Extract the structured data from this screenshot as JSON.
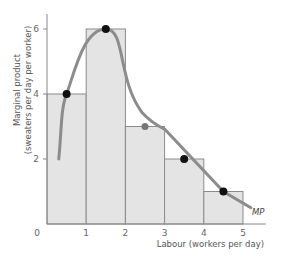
{
  "chart_data": {
    "type": "bar",
    "title": "",
    "xlabel": "Labour (workers per day)",
    "ylabel_line1": "Marginal product",
    "ylabel_line2": "(sweaters per day per worker)",
    "x_ticks": [
      "0",
      "1",
      "2",
      "3",
      "4",
      "5"
    ],
    "y_ticks": [
      "2",
      "4",
      "6"
    ],
    "xlim": [
      0,
      5.5
    ],
    "ylim": [
      0,
      6.5
    ],
    "grid": false,
    "bars": [
      {
        "x_start": 0,
        "x_end": 1,
        "value": 4
      },
      {
        "x_start": 1,
        "x_end": 2,
        "value": 6
      },
      {
        "x_start": 2,
        "x_end": 3,
        "value": 3
      },
      {
        "x_start": 3,
        "x_end": 4,
        "value": 2
      },
      {
        "x_start": 4,
        "x_end": 5,
        "value": 1
      }
    ],
    "series": [
      {
        "name": "MP",
        "type": "line",
        "points": [
          {
            "x": 0.5,
            "y": 4
          },
          {
            "x": 1.5,
            "y": 6
          },
          {
            "x": 2.5,
            "y": 3
          },
          {
            "x": 3.5,
            "y": 2
          },
          {
            "x": 4.5,
            "y": 1
          }
        ],
        "curve_start": {
          "x": 0.3,
          "y": 2
        },
        "curve_end": {
          "x": 5.2,
          "y": 0.5
        }
      }
    ],
    "curve_label": "MP",
    "colors": {
      "bar_fill": "#e4e4e4",
      "bar_stroke": "#8a8a8a",
      "curve": "#8c8c8c",
      "points": "#111111",
      "axis": "#888888"
    }
  }
}
